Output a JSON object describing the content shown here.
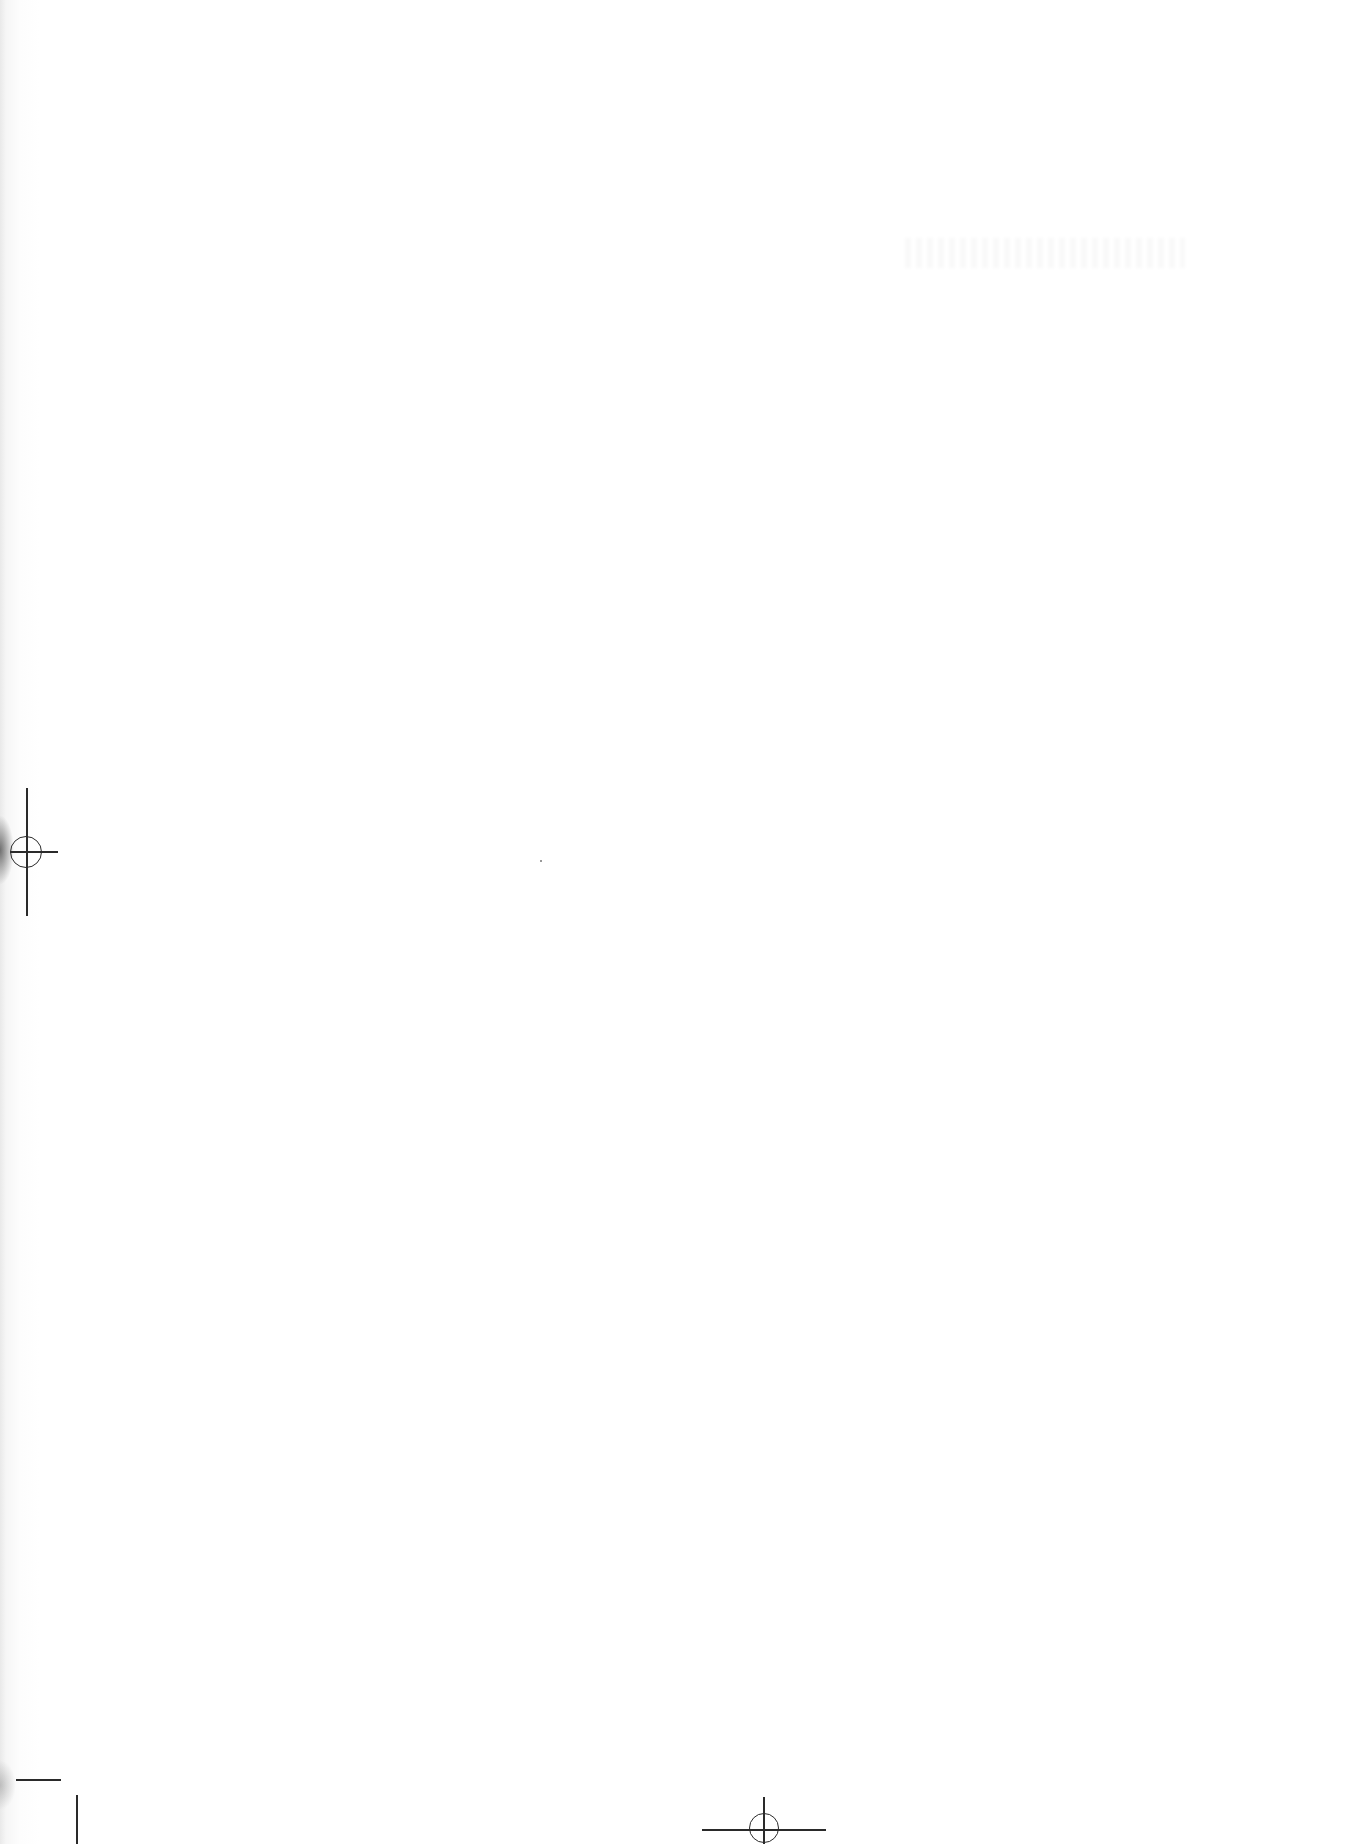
{
  "page": {
    "type": "blank-scanned-page",
    "background_color": "#ffffff",
    "mark_color": "#2a2a2a",
    "registration_marks": [
      {
        "position": "left-middle",
        "shape": "crosshair-circle"
      },
      {
        "position": "bottom-center",
        "shape": "crosshair-half-circle"
      },
      {
        "position": "bottom-left",
        "shape": "crop-mark"
      }
    ],
    "visible_text": []
  }
}
